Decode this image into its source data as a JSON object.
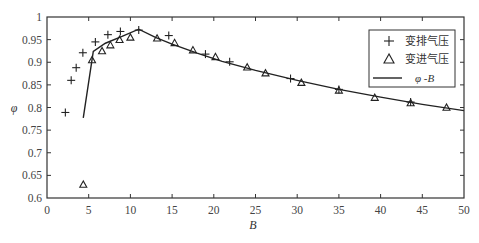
{
  "chart_data": {
    "type": "line",
    "title": "",
    "xlabel": "B",
    "ylabel": "φ",
    "xlim": [
      0,
      50
    ],
    "ylim": [
      0.6,
      1.0
    ],
    "xticks": [
      0,
      5,
      10,
      15,
      20,
      25,
      30,
      35,
      40,
      45,
      50
    ],
    "xtick_labels": [
      "0",
      "5",
      "10",
      "15",
      "20",
      "25",
      "30",
      "35",
      "40",
      "45",
      "50"
    ],
    "yticks": [
      0.6,
      0.65,
      0.7,
      0.75,
      0.8,
      0.85,
      0.9,
      0.95,
      1.0
    ],
    "ytick_labels": [
      "0.6",
      "0.65",
      "0.7",
      "0.75",
      "0.8",
      "0.85",
      "0.9",
      "0.95",
      "1"
    ],
    "grid": false,
    "legend_position": "upper right",
    "series": [
      {
        "name": "变排气压",
        "type": "scatter",
        "marker": "plus",
        "x": [
          2.2,
          2.9,
          3.5,
          4.3,
          5.8,
          7.3,
          8.8,
          11.0,
          14.6,
          19.0,
          21.9,
          29.2,
          35.0,
          43.6
        ],
        "y": [
          0.789,
          0.86,
          0.888,
          0.921,
          0.945,
          0.961,
          0.968,
          0.971,
          0.959,
          0.918,
          0.901,
          0.864,
          0.84,
          0.812
        ]
      },
      {
        "name": "变进气压",
        "type": "scatter",
        "marker": "triangle",
        "x": [
          4.35,
          5.4,
          6.6,
          7.6,
          8.7,
          10.0,
          13.2,
          15.3,
          17.5,
          20.2,
          24.0,
          26.2,
          30.5,
          35.0,
          39.3,
          43.6,
          47.9
        ],
        "y": [
          0.63,
          0.905,
          0.925,
          0.938,
          0.95,
          0.955,
          0.953,
          0.943,
          0.927,
          0.912,
          0.889,
          0.876,
          0.855,
          0.838,
          0.822,
          0.81,
          0.8
        ]
      },
      {
        "name": "φ -B",
        "type": "line",
        "x": [
          4.35,
          5.55,
          7,
          9,
          11.0,
          13,
          15,
          18,
          21,
          25,
          30,
          35,
          40,
          45,
          50
        ],
        "y": [
          0.777,
          0.924,
          0.942,
          0.957,
          0.973,
          0.955,
          0.94,
          0.92,
          0.902,
          0.882,
          0.86,
          0.84,
          0.823,
          0.807,
          0.793
        ]
      }
    ]
  },
  "legend": {
    "items": [
      {
        "symbol": "+",
        "label": "变排气压"
      },
      {
        "symbol": "△",
        "label": "变进气压"
      },
      {
        "symbol": "—",
        "label": "φ -B"
      }
    ]
  },
  "axes": {
    "xlabel": "B",
    "ylabel": "φ"
  }
}
